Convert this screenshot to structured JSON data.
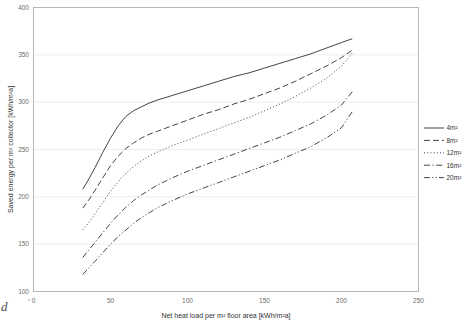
{
  "figure": {
    "background_color": "#ffffff",
    "line_color": "#3a3a3a",
    "axis_color": "#b0b0b0",
    "grid_color": "#e8e8ee",
    "tick_label_color": "#6b6b6b",
    "axis_label_color": "#333333",
    "corner_artifact": "d"
  },
  "chart_data": {
    "type": "line",
    "title": "",
    "xlabel": "Net heat load per m² floor area [kWh/m²a]",
    "ylabel": "Saved energy per m² collector [kWh/m²a]",
    "xlim": [
      0,
      250
    ],
    "ylim": [
      100,
      400
    ],
    "xticks": [
      0,
      50,
      100,
      150,
      200,
      250
    ],
    "yticks": [
      100,
      150,
      200,
      250,
      300,
      350,
      400
    ],
    "xtick_labels": [
      "0",
      "50",
      "100",
      "150",
      "200",
      "250"
    ],
    "ytick_labels": [
      "100",
      "150",
      "200",
      "250",
      "300",
      "350",
      "400"
    ],
    "grid": "horizontal",
    "legend_position": "right",
    "x": [
      32,
      36,
      40,
      45,
      50,
      55,
      60,
      65,
      70,
      75,
      80,
      90,
      100,
      110,
      120,
      130,
      140,
      150,
      160,
      170,
      180,
      190,
      200,
      207
    ],
    "series": [
      {
        "name": "4m²",
        "label": "4m²",
        "dash": "solid",
        "values": [
          208,
          219,
          231,
          247,
          262,
          275,
          285,
          291,
          295,
          299,
          302,
          307,
          312,
          317,
          322,
          327,
          331,
          336,
          341,
          346,
          351,
          357,
          363,
          367
        ]
      },
      {
        "name": "8m²",
        "label": "8m²",
        "dash": "dashed",
        "values": [
          188,
          197,
          207,
          220,
          233,
          243,
          251,
          257,
          262,
          266,
          269,
          275,
          281,
          287,
          292,
          298,
          303,
          309,
          315,
          322,
          330,
          338,
          347,
          355
        ]
      },
      {
        "name": "12m²",
        "label": "12m²",
        "dash": "dotted",
        "values": [
          165,
          173,
          182,
          194,
          206,
          216,
          225,
          232,
          238,
          243,
          247,
          254,
          260,
          266,
          272,
          278,
          284,
          291,
          298,
          306,
          315,
          325,
          338,
          352
        ]
      },
      {
        "name": "16m²",
        "label": "16m²",
        "dash": "dashdot",
        "values": [
          136,
          144,
          152,
          162,
          172,
          181,
          189,
          196,
          202,
          207,
          212,
          220,
          227,
          233,
          239,
          245,
          251,
          257,
          263,
          270,
          277,
          286,
          297,
          311
        ]
      },
      {
        "name": "20m²",
        "label": "20m²",
        "dash": "dashdotdot",
        "values": [
          118,
          125,
          132,
          141,
          150,
          158,
          165,
          172,
          178,
          183,
          188,
          196,
          203,
          209,
          215,
          221,
          227,
          233,
          239,
          246,
          253,
          262,
          273,
          290
        ]
      }
    ]
  }
}
